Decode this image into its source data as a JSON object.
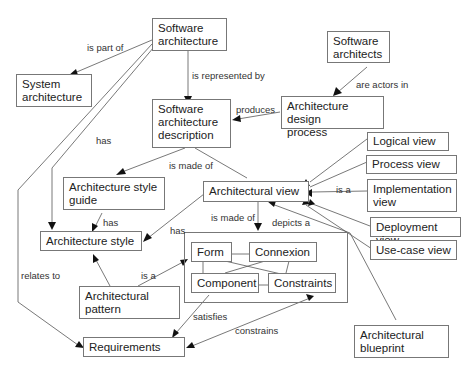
{
  "diagram": {
    "type": "concept-map",
    "nodes": {
      "software_architecture": "Software\narchitecture",
      "system_architecture": "System\narchitecture",
      "software_architects": "Software\narchitects",
      "sa_description": "Software\narchitecture\ndescription",
      "design_process": "Architecture design\nprocess",
      "style_guide": "Architecture style\nguide",
      "architectural_view": "Architectural view",
      "logical_view": "Logical view",
      "process_view": "Process view",
      "implementation_view": "Implementation\nview",
      "deployment_view": "Deployment view",
      "usecase_view": "Use-case view",
      "architecture_style": "Architecture style",
      "form": "Form",
      "connexion": "Connexion",
      "component": "Component",
      "constraints": "Constraints",
      "architectural_pattern": "Architectural\npattern",
      "requirements": "Requirements",
      "architectural_blueprint": "Architectural\nblueprint"
    },
    "edge_labels": {
      "is_part_of": "is part of",
      "is_represented_by": "is represented  by",
      "are_actors_in": "are actors in",
      "produces": "produces",
      "has_top": "has",
      "is_made_of_1": "is made of",
      "has_guide": "has",
      "is_made_of_2": "is made of",
      "depicts_a": "depicts a",
      "is_a_views": "is a",
      "has_view_style": "has",
      "relates_to": "relates to",
      "is_a_pattern": "is a",
      "satisfies": "satisfies",
      "constrains": "constrains"
    },
    "edges": [
      {
        "from": "Software architecture",
        "to": "System architecture",
        "label": "is part of"
      },
      {
        "from": "Software architecture",
        "to": "Software architecture description",
        "label": "is represented by"
      },
      {
        "from": "Software architects",
        "to": "Architecture design process",
        "label": "are actors in"
      },
      {
        "from": "Architecture design process",
        "to": "Software architecture description",
        "label": "produces"
      },
      {
        "from": "Software architecture",
        "to": "Architecture style",
        "label": "has"
      },
      {
        "from": "Software architecture",
        "to": "Requirements",
        "label": "relates to"
      },
      {
        "from": "Software architecture description",
        "to": "Architecture style guide",
        "label": "is made of"
      },
      {
        "from": "Software architecture description",
        "to": "Architectural view",
        "label": "is made of"
      },
      {
        "from": "Architecture style guide",
        "to": "Architecture style",
        "label": "has"
      },
      {
        "from": "Architectural view",
        "to": "Architecture style",
        "label": "has"
      },
      {
        "from": "Architectural view",
        "to": "Form/Connexion/Component/Constraints",
        "label": "is made of"
      },
      {
        "from": "Logical view",
        "to": "Architectural view",
        "label": "is a"
      },
      {
        "from": "Process view",
        "to": "Architectural view",
        "label": "is a"
      },
      {
        "from": "Implementation view",
        "to": "Architectural view",
        "label": "is a"
      },
      {
        "from": "Deployment view",
        "to": "Architectural view",
        "label": "is a"
      },
      {
        "from": "Use-case view",
        "to": "Architectural view",
        "label": "is a"
      },
      {
        "from": "Architectural blueprint",
        "to": "Architectural view",
        "label": "depicts a"
      },
      {
        "from": "Architectural pattern",
        "to": "Architecture style",
        "label": "is a"
      },
      {
        "from": "Architectural pattern",
        "to": "Form",
        "label": "is a"
      },
      {
        "from": "Component",
        "to": "Requirements",
        "label": "satisfies"
      },
      {
        "from": "Constraints",
        "to": "Requirements",
        "label": "constrains"
      }
    ]
  }
}
